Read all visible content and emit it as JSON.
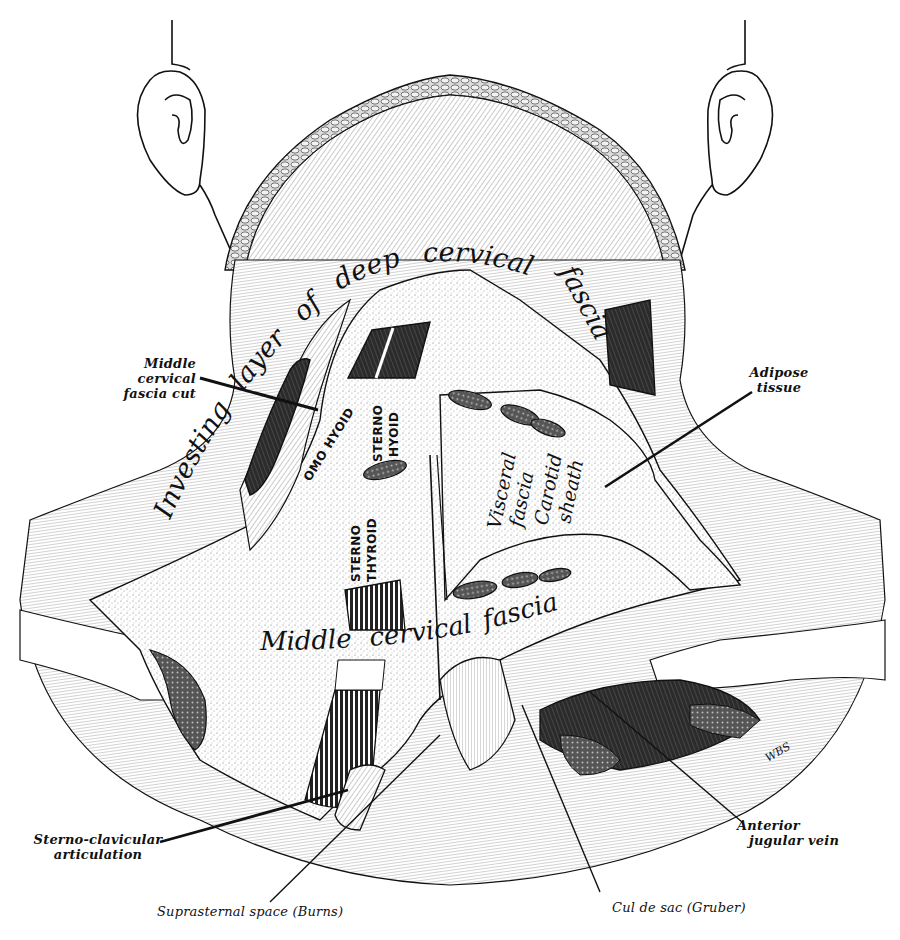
{
  "figure": {
    "kind": "anatomical illustration",
    "signature": "WBS"
  },
  "labels": {
    "middle_cervical_fascia_cut": [
      "Middle cervical",
      "fascia cut"
    ],
    "adipose_tissue": [
      "Adipose",
      "tissue"
    ],
    "sterno_clavicular": [
      "Sterno-clavicular",
      "articulation"
    ],
    "suprasternal_space": "Suprasternal space (Burns)",
    "cul_de_sac": "Cul de sac (Gruber)",
    "anterior_jugular_vein": [
      "Anterior",
      "jugular vein"
    ]
  },
  "inline_labels": {
    "investing_layer": [
      "Investing",
      "layer",
      "of",
      "deep",
      "cervical",
      "fascia"
    ],
    "middle_cervical_fascia": [
      "Middle",
      "cervical",
      "fascia"
    ],
    "omo_hyoid": "OMO HYOID",
    "sterno_hyoid": [
      "STERNO",
      "HYOID"
    ],
    "sterno_thyroid": [
      "STERNO",
      "THYROID"
    ],
    "visceral_fascia": [
      "Visceral",
      "fascia"
    ],
    "carotid_sheath": [
      "Carotid",
      "sheath"
    ]
  },
  "colors": {
    "ink": "#111111",
    "paper": "#ffffff",
    "shade_light": "#e6e6e6",
    "shade_mid": "#bdbdbd",
    "shade_dark": "#3a3a3a"
  }
}
